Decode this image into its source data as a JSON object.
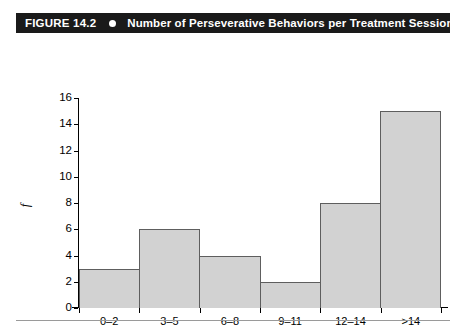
{
  "banner": {
    "figure_label": "FIGURE 14.2",
    "bullet_icon": "bullet-dot-icon",
    "title": "Number of Perseverative Behaviors per Treatment Session",
    "background_color": "#1a1a1a",
    "text_color": "#ffffff"
  },
  "chart_data": {
    "type": "bar",
    "title": "Number of Perseverative Behaviors per Treatment Session",
    "categories": [
      "0–2",
      "3–5",
      "6–8",
      "9–11",
      "12–14",
      ">14"
    ],
    "values": [
      3,
      6,
      4,
      2,
      8,
      15
    ],
    "xlabel": "Perseverative Beh. (Min/Session)",
    "ylabel": "f",
    "ylim": [
      0,
      16
    ],
    "ytick_labels": [
      "16",
      "14",
      "12",
      "10",
      "8",
      "6",
      "4",
      "2",
      "0"
    ],
    "ytick_values": [
      16,
      14,
      12,
      10,
      8,
      6,
      4,
      2,
      0
    ],
    "ytick_step": 2,
    "grid": false,
    "legend": false,
    "bar_fill_color": "#d2d2d2",
    "bar_edge_color": "#5e5e5e",
    "axis_color": "#000000",
    "bars_adjacent": true
  },
  "footer": {
    "rule_color": "#9a9a9a"
  }
}
